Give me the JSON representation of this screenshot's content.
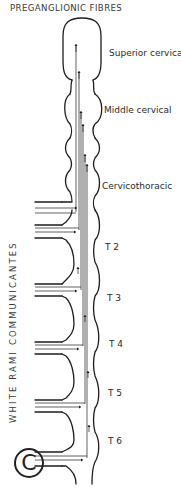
{
  "diagram": {
    "title": "PREGANGLIONIC FIBRES",
    "side_label": "WHITE RAMI COMMUNICANTES",
    "ganglia": [
      {
        "label": "Superior cervical",
        "x": 109,
        "y": 49
      },
      {
        "label": "Middle cervical",
        "x": 104,
        "y": 106
      },
      {
        "label": "Cervicothoracic",
        "x": 102,
        "y": 182
      },
      {
        "label": "T 2",
        "x": 105,
        "y": 243
      },
      {
        "label": "T 3",
        "x": 107,
        "y": 294
      },
      {
        "label": "T 4",
        "x": 109,
        "y": 340
      },
      {
        "label": "T 5",
        "x": 108,
        "y": 389
      },
      {
        "label": "T 6",
        "x": 108,
        "y": 437
      }
    ],
    "corner_mark": "C",
    "line_color": "#1e1e1e"
  }
}
